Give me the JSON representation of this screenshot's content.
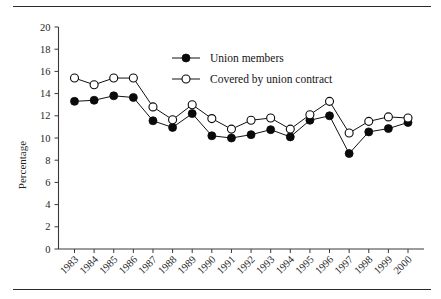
{
  "figure": {
    "rule_top": "horizontal-rule",
    "rule_bottom": "horizontal-rule"
  },
  "chart_data": {
    "type": "line",
    "title": "",
    "subtitle": "",
    "xlabel": "",
    "ylabel": "Percentage",
    "ylim": [
      0,
      20
    ],
    "yticks": [
      0,
      2,
      4,
      6,
      8,
      10,
      12,
      14,
      16,
      18,
      20
    ],
    "ytick_labels": [
      "0",
      "2",
      "4",
      "6",
      "8",
      "10",
      "12",
      "14",
      "16",
      "18",
      "20"
    ],
    "grid": false,
    "legend_position": "top-center",
    "categories": [
      "1983",
      "1984",
      "1985",
      "1986",
      "1987",
      "1988",
      "1989",
      "1990",
      "1991",
      "1992",
      "1993",
      "1994",
      "1995",
      "1996",
      "1997",
      "1998",
      "1999",
      "2000"
    ],
    "x": [
      1983,
      1984,
      1985,
      1986,
      1987,
      1988,
      1989,
      1990,
      1991,
      1992,
      1993,
      1994,
      1995,
      1996,
      1997,
      1998,
      1999,
      2000
    ],
    "series": [
      {
        "name": "Union members",
        "marker": "filled-circle",
        "values": [
          13.3,
          13.4,
          13.8,
          13.65,
          11.55,
          10.95,
          12.2,
          10.2,
          10.0,
          10.3,
          10.75,
          10.1,
          11.6,
          12.0,
          8.6,
          10.55,
          10.85,
          11.4
        ]
      },
      {
        "name": "Covered by union contract",
        "marker": "open-circle",
        "values": [
          15.4,
          14.8,
          15.4,
          15.4,
          12.8,
          11.65,
          13.0,
          11.75,
          10.8,
          11.6,
          11.8,
          10.8,
          12.1,
          13.3,
          10.45,
          11.5,
          11.9,
          11.8
        ]
      }
    ]
  },
  "legend": {
    "items": [
      {
        "label": "Union members",
        "marker": "filled-circle"
      },
      {
        "label": "Covered by union contract",
        "marker": "open-circle"
      }
    ]
  }
}
